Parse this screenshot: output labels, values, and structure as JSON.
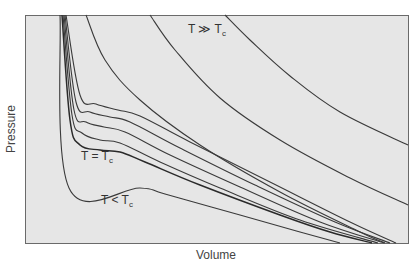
{
  "chart_data": {
    "type": "line",
    "title": "",
    "xlabel": "Volume",
    "ylabel": "Pressure",
    "grid": false,
    "legend": "none",
    "annotations": [
      {
        "text": "T ≫ T",
        "sub": "c",
        "position": "upper right, beside highest isotherm"
      },
      {
        "text": "T = T",
        "sub": "c",
        "position": "below critical isotherm plateau"
      },
      {
        "text": "T < T",
        "sub": "c",
        "position": "below sub-critical flat segment"
      }
    ],
    "series": [
      {
        "name": "T < Tc",
        "style": "thin",
        "points_px": [
          [
            60,
            15
          ],
          [
            69,
            188
          ],
          [
            140,
            188
          ],
          [
            165,
            194
          ],
          [
            240,
            215
          ],
          [
            300,
            232
          ],
          [
            340,
            243
          ]
        ]
      },
      {
        "name": "T = Tc",
        "style": "thick",
        "points_px": [
          [
            62,
            15
          ],
          [
            70,
            120
          ],
          [
            80,
            145
          ],
          [
            100,
            150
          ],
          [
            120,
            152
          ],
          [
            145,
            162
          ],
          [
            200,
            185
          ],
          [
            280,
            215
          ],
          [
            330,
            232
          ],
          [
            372,
            243
          ]
        ]
      },
      {
        "name": "T1",
        "style": "thin",
        "points_px": [
          [
            63,
            15
          ],
          [
            72,
            115
          ],
          [
            82,
            133
          ],
          [
            100,
            140
          ],
          [
            120,
            143
          ],
          [
            160,
            162
          ],
          [
            220,
            188
          ],
          [
            300,
            220
          ],
          [
            378,
            243
          ]
        ]
      },
      {
        "name": "T2",
        "style": "thin",
        "points_px": [
          [
            64,
            15
          ],
          [
            74,
            110
          ],
          [
            86,
            122
          ],
          [
            104,
            127
          ],
          [
            125,
            132
          ],
          [
            170,
            155
          ],
          [
            240,
            187
          ],
          [
            320,
            222
          ],
          [
            384,
            243
          ]
        ]
      },
      {
        "name": "T3",
        "style": "thin",
        "points_px": [
          [
            65,
            15
          ],
          [
            76,
            102
          ],
          [
            90,
            112
          ],
          [
            110,
            117
          ],
          [
            130,
            122
          ],
          [
            180,
            148
          ],
          [
            255,
            185
          ],
          [
            335,
            222
          ],
          [
            390,
            243
          ]
        ]
      },
      {
        "name": "T4",
        "style": "thin",
        "points_px": [
          [
            66,
            15
          ],
          [
            80,
            95
          ],
          [
            96,
            104
          ],
          [
            118,
            110
          ],
          [
            140,
            116
          ],
          [
            190,
            142
          ],
          [
            270,
            182
          ],
          [
            350,
            222
          ],
          [
            396,
            243
          ]
        ]
      },
      {
        "name": "T5",
        "style": "thin",
        "points_px": [
          [
            86,
            15
          ],
          [
            105,
            60
          ],
          [
            140,
            100
          ],
          [
            200,
            145
          ],
          [
            280,
            192
          ],
          [
            360,
            232
          ],
          [
            385,
            243
          ]
        ]
      },
      {
        "name": "T6",
        "style": "thin",
        "points_px": [
          [
            150,
            15
          ],
          [
            175,
            50
          ],
          [
            220,
            98
          ],
          [
            280,
            140
          ],
          [
            350,
            178
          ],
          [
            408,
            205
          ]
        ]
      },
      {
        "name": "T ≫ Tc",
        "style": "thin",
        "points_px": [
          [
            225,
            15
          ],
          [
            250,
            40
          ],
          [
            290,
            76
          ],
          [
            340,
            112
          ],
          [
            408,
            145
          ]
        ]
      }
    ],
    "xlim": [
      25,
      408
    ],
    "ylim": [
      243,
      15
    ]
  }
}
